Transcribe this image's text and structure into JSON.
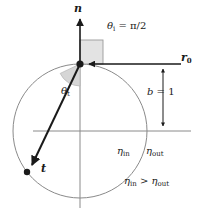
{
  "figure": {
    "canvas": {
      "width": 201,
      "height": 211,
      "background": "#ffffff"
    }
  },
  "colors": {
    "stroke_dark": "#1a1a1a",
    "circle_stroke": "#8a8a8a",
    "axis_stroke": "#8a8a8a",
    "wedge_fill": "#d6d6d6",
    "wedge_stroke": "#9a9a9a",
    "right_angle_fill": "#e3e3e3",
    "right_angle_stroke": "#9a9a9a",
    "point_fill": "#1a1a1a",
    "text": "#1a1a1a"
  },
  "geometry": {
    "circle": {
      "cx": 80,
      "cy": 131,
      "r": 67
    },
    "hit_point": {
      "x": 80,
      "y": 64
    },
    "exit_point": {
      "x": 27,
      "y": 172
    },
    "normal_arrow": {
      "x1": 80,
      "y1": 64,
      "x2": 80,
      "y2": 18
    },
    "incident_ray": {
      "x1": 181,
      "y1": 64,
      "x2": 88,
      "y2": 64
    },
    "transmitted_ray": {
      "x1": 80,
      "y1": 64,
      "x2": 30,
      "y2": 168
    },
    "vertical_axis": {
      "x": 80,
      "y1": 62,
      "y2": 208
    },
    "horizontal_axis": {
      "y": 131,
      "x1": 33,
      "x2": 191
    },
    "dimension_line": {
      "x": 163,
      "y1": 64,
      "y2": 131
    },
    "right_angle_box": {
      "x": 80,
      "y": 40,
      "w": 23,
      "h": 24
    },
    "theta_t_wedge": {
      "cx": 80,
      "cy": 64,
      "r": 22,
      "start_deg": 90,
      "end_deg": 154
    }
  },
  "labels": {
    "normal": {
      "text": "n",
      "x": 75,
      "y": 5
    },
    "incident_ray": {
      "text": "r",
      "sub": "0",
      "x": 182,
      "y": 56
    },
    "incident_angle": {
      "theta": "θ",
      "sub": "i",
      "equals": " = ",
      "value": "π/2",
      "full": "θi = π/2",
      "x": 108,
      "y": 26
    },
    "transmitted_angle": {
      "theta": "θ",
      "sub": "t",
      "full": "θt",
      "x": 62,
      "y": 90
    },
    "transmitted_vector": {
      "text": "t",
      "x": 42,
      "y": 167
    },
    "impact_parameter": {
      "symbol": "b",
      "equals": " = ",
      "value": "1",
      "full": "b = 1",
      "x": 148,
      "y": 92
    },
    "eta_in": {
      "symbol": "η",
      "sub": "in",
      "full": "ηin",
      "x": 118,
      "y": 150
    },
    "eta_out": {
      "symbol": "η",
      "sub": "out",
      "full": "ηout",
      "x": 147,
      "y": 150
    },
    "inequality": {
      "left_symbol": "η",
      "left_sub": "in",
      "operator": " > ",
      "right_symbol": "η",
      "right_sub": "out",
      "full": "ηin > ηout",
      "x": 127,
      "y": 180
    }
  }
}
